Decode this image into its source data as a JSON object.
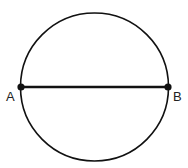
{
  "diagram": {
    "points": [
      {
        "id": "A",
        "label": "A"
      },
      {
        "id": "B",
        "label": "B"
      }
    ],
    "segment": {
      "from": "A",
      "to": "B",
      "kind": "diameter"
    },
    "colors": {
      "stroke": "#111111",
      "background": "#ffffff",
      "label": "#222222"
    }
  }
}
